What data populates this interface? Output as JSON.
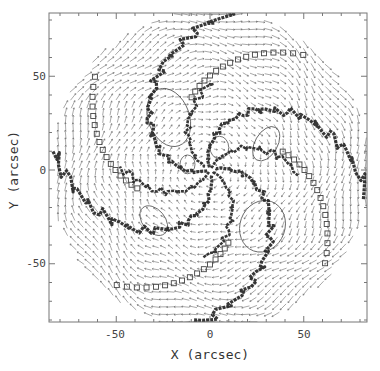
{
  "chart_data": {
    "type": "vector_field",
    "title": "",
    "xlabel": "X (arcsec)",
    "ylabel": "Y (arcsec)",
    "xlim": [
      -85,
      85
    ],
    "ylim": [
      -85,
      80
    ],
    "xticks": [
      -50,
      0,
      50
    ],
    "yticks": [
      -50,
      0,
      50
    ],
    "xtick_labels": [
      "-50",
      "0",
      "50"
    ],
    "ytick_labels": [
      "-50",
      "0",
      "50"
    ],
    "minor_tick_step": 10,
    "grid": false,
    "legend": null,
    "disk_radius_arcsec": 85,
    "center": [
      0,
      0
    ],
    "field": {
      "description": "Velocity arrows sampled on a regular grid within a circular disk; circular (rotational) flow pattern",
      "grid_spacing_arcsec": 4,
      "rotation_sense": "clockwise_on_sky"
    },
    "spiral_ridges": {
      "description": "Dark ridge lines (filled markers) forming a multi-armed spiral pattern from the center",
      "arm_count": 8,
      "marker": "filled"
    },
    "square_markers": {
      "description": "Open square markers tracing outer spiral arcs",
      "marker": "open-square"
    },
    "contours": {
      "description": "Closed contour loops between arms",
      "count": 6
    }
  },
  "axes": {
    "x_label": "X (arcsec)",
    "y_label": "Y (arcsec)",
    "x_ticks": [
      {
        "value": -50,
        "label": "-50"
      },
      {
        "value": 0,
        "label": "0"
      },
      {
        "value": 50,
        "label": "50"
      }
    ],
    "y_ticks": [
      {
        "value": 50,
        "label": "50"
      },
      {
        "value": 0,
        "label": "0"
      },
      {
        "value": -50,
        "label": "-50"
      }
    ]
  },
  "colors": {
    "frame": "#777777",
    "arrows": "#555555",
    "ridges": "#222222",
    "squares": "#444444",
    "contours": "#555555",
    "background": "#ffffff"
  }
}
